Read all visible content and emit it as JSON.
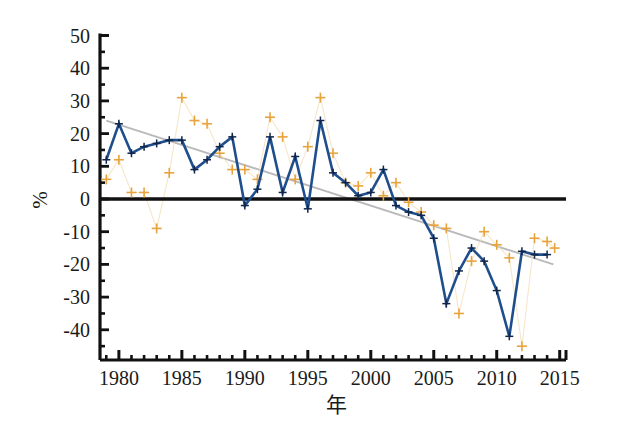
{
  "chart_data": {
    "type": "line",
    "title": "",
    "subtitle": "",
    "xlabel": "年",
    "ylabel": "%",
    "xlim": [
      1978.5,
      2015.5
    ],
    "ylim": [
      -50,
      50
    ],
    "grid": false,
    "legend": "none",
    "x_ticks": [
      1980,
      1985,
      1990,
      1995,
      2000,
      2005,
      2010,
      2015
    ],
    "x_tick_labels": [
      "1980",
      "1985",
      "1990",
      "1995",
      "2000",
      "2005",
      "2010",
      "2015"
    ],
    "x_minor_tick_step": 1,
    "y_ticks": [
      -40,
      -30,
      -20,
      -10,
      0,
      10,
      20,
      30,
      40,
      50
    ],
    "y_tick_labels": [
      "-40",
      "-30",
      "-20",
      "-10",
      "0",
      "10",
      "20",
      "30",
      "40",
      "50"
    ],
    "y_minor_tick_step": 5,
    "zero_line": 0,
    "x": [
      1979,
      1980,
      1981,
      1982,
      1983,
      1984,
      1985,
      1986,
      1987,
      1988,
      1989,
      1990,
      1991,
      1992,
      1993,
      1994,
      1995,
      1996,
      1997,
      1998,
      1999,
      2000,
      2001,
      2002,
      2003,
      2004,
      2005,
      2006,
      2007,
      2008,
      2009,
      2010,
      2011,
      2012,
      2013,
      2014
    ],
    "series": [
      {
        "name": "annual-series",
        "kind": "line-with-markers",
        "color": "#1f4e8c",
        "marker": "plus",
        "values": [
          12,
          23,
          14,
          16,
          17,
          18,
          18,
          9,
          12,
          16,
          19,
          -2,
          3,
          19,
          2,
          13,
          -3,
          24,
          8,
          5,
          1,
          2,
          9,
          -2,
          -4,
          -5,
          -12,
          -32,
          -22,
          -15,
          -19,
          -28,
          -42,
          -16,
          -17,
          -17
        ]
      },
      {
        "name": "scatter-points",
        "kind": "scatter",
        "color": "#e8a33d",
        "marker": "plus",
        "points": [
          [
            1979,
            6
          ],
          [
            1980,
            12
          ],
          [
            1981,
            2
          ],
          [
            1982,
            2
          ],
          [
            1983,
            -9
          ],
          [
            1984,
            8
          ],
          [
            1985,
            31
          ],
          [
            1986,
            24
          ],
          [
            1987,
            23
          ],
          [
            1988,
            14
          ],
          [
            1989,
            9
          ],
          [
            1990,
            9
          ],
          [
            1991,
            6
          ],
          [
            1992,
            25
          ],
          [
            1993,
            19
          ],
          [
            1994,
            6
          ],
          [
            1995,
            16
          ],
          [
            1996,
            31
          ],
          [
            1997,
            14
          ],
          [
            1998,
            5
          ],
          [
            1999,
            4
          ],
          [
            2000,
            8
          ],
          [
            2001,
            1
          ],
          [
            2002,
            5
          ],
          [
            2003,
            -1
          ],
          [
            2004,
            -4
          ],
          [
            2005,
            -8
          ],
          [
            2006,
            -9
          ],
          [
            2007,
            -35
          ],
          [
            2008,
            -19
          ],
          [
            2009,
            -10
          ],
          [
            2010,
            -14
          ],
          [
            2011,
            -18
          ],
          [
            2012,
            -45
          ],
          [
            2013,
            -12
          ],
          [
            2014,
            -13
          ],
          [
            2014.6,
            -15
          ]
        ]
      },
      {
        "name": "trend-line",
        "kind": "line",
        "color": "#b9b9b9",
        "start": [
          1979,
          24
        ],
        "end": [
          2014.5,
          -20
        ]
      }
    ],
    "annotations": []
  },
  "figure": {
    "axis_color": "#111111",
    "background": "#ffffff",
    "y_axis_title": "%",
    "x_axis_title": "年"
  }
}
